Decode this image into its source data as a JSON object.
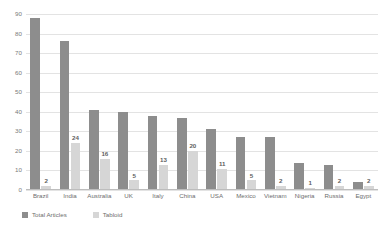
{
  "chart_data": {
    "type": "bar",
    "title": "",
    "subtitle": "",
    "xlabel": "",
    "ylabel": "",
    "ylim": [
      0,
      90
    ],
    "ytick_step": 10,
    "grid": true,
    "legend_position": "bottom-left",
    "categories": [
      "Brazil",
      "India",
      "Australia",
      "UK",
      "Italy",
      "China",
      "USA",
      "Mexico",
      "Vietnam",
      "Nigeria",
      "Russia",
      "Egypt"
    ],
    "yticks": [
      "0",
      "10",
      "20",
      "30",
      "40",
      "50",
      "60",
      "70",
      "80",
      "90"
    ],
    "series": [
      {
        "name": "Total Articles",
        "color": "#8d8d8d",
        "values": [
          88,
          76,
          41,
          40,
          38,
          37,
          31,
          27,
          27,
          14,
          13,
          4
        ],
        "show_labels": false
      },
      {
        "name": "Tabloid",
        "color": "#d6d6d6",
        "values": [
          2,
          24,
          16,
          5,
          13,
          20,
          11,
          5,
          2,
          1,
          2,
          2
        ],
        "show_labels": true,
        "labels": [
          "2",
          "24",
          "16",
          "5",
          "13",
          "20",
          "11",
          "5",
          "2",
          "1",
          "2",
          "2"
        ]
      }
    ]
  },
  "legend": {
    "items": [
      {
        "label": "Total Articles",
        "swatch": "total"
      },
      {
        "label": "Tabloid",
        "swatch": "tabloid"
      }
    ]
  }
}
